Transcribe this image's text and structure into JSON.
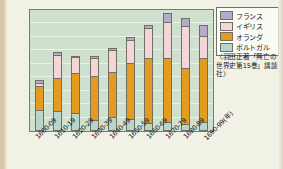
{
  "chart_data": {
    "type": "bar",
    "stacked": true,
    "title": "",
    "xlabel": "(年)",
    "ylabel": "(隻)",
    "ylim": [
      0,
      450
    ],
    "ytick_step": 50,
    "yticks": [
      "450",
      "400",
      "350",
      "300",
      "250",
      "200",
      "150",
      "100",
      "50",
      "0"
    ],
    "grid": true,
    "legend_position": "top-right",
    "categories": [
      "1600-09",
      "1610-19",
      "1620-29",
      "1630-39",
      "1640-49",
      "1650-59",
      "1660-69",
      "1670-79",
      "1680-89",
      "1690-99(年)"
    ],
    "series": [
      {
        "name": "ポルトガル",
        "color": "#b9d4cb",
        "values": [
          70,
          68,
          60,
          35,
          45,
          36,
          22,
          27,
          20,
          25
        ]
      },
      {
        "name": "オランダ",
        "color": "#e49b20",
        "values": [
          85,
          118,
          145,
          158,
          165,
          207,
          240,
          232,
          205,
          235
        ]
      },
      {
        "name": "イギリス",
        "color": "#f5d6d8",
        "values": [
          10,
          82,
          57,
          63,
          78,
          80,
          108,
          133,
          152,
          80
        ]
      },
      {
        "name": "フランス",
        "color": "#b4abcc",
        "values": [
          5,
          7,
          0,
          5,
          4,
          7,
          5,
          28,
          25,
          35
        ]
      }
    ],
    "totals": [
      170,
      275,
      262,
      261,
      292,
      330,
      375,
      420,
      402,
      375
    ]
  },
  "legend": {
    "items": [
      {
        "label": "フランス",
        "color": "#b4abcc"
      },
      {
        "label": "イギリス",
        "color": "#f5d6d8"
      },
      {
        "label": "オランダ",
        "color": "#e49b20"
      },
      {
        "label": "ポルトガル",
        "color": "#b9d4cb"
      }
    ]
  },
  "source": {
    "note": "〈羽田正著「興亡の世界史第15巻」講談社〉"
  },
  "colors": {
    "plot_background": "#cfe0cf",
    "page_background": "#f2f1e6",
    "axis": "#6f6f64",
    "text": "#15161a"
  }
}
